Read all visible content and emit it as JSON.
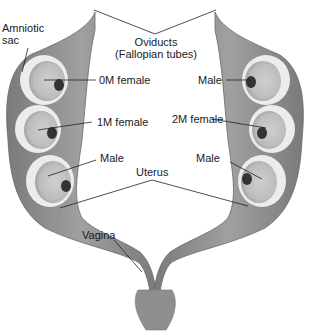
{
  "diagram": {
    "colors": {
      "tissue": "#8c8c8c",
      "tissue_dark": "#6e6e6e",
      "sac": "#e6e6e6",
      "sac_inner": "#c9c9c9",
      "placenta": "#3a3a3a",
      "line": "#222222"
    },
    "labels": {
      "amniotic_sac_line1": "Amniotic",
      "amniotic_sac_line2": "sac",
      "oviducts_line1": "Oviducts",
      "oviducts_line2": "(Fallopian tubes)",
      "left_fetus_1": "0M female",
      "left_fetus_2": "1M female",
      "left_fetus_3": "Male",
      "right_fetus_1": "Male",
      "right_fetus_2": "2M female",
      "right_fetus_3": "Male",
      "uterus": "Uterus",
      "vagina": "Vagina"
    }
  }
}
